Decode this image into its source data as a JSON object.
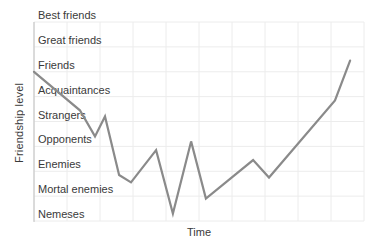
{
  "figure": {
    "y_axis_title": "Friendship level",
    "x_axis_title": "Time"
  },
  "chart_data": {
    "type": "line",
    "title": "",
    "xlabel": "Time",
    "ylabel": "Friendship level",
    "y_categories_bottom_up": [
      "Nemeses",
      "Mortal enemies",
      "Enemies",
      "Opponents",
      "Strangers",
      "Acquaintances",
      "Friends",
      "Great friends",
      "Best friends"
    ],
    "x_range": [
      0,
      100
    ],
    "y_range": [
      0,
      8
    ],
    "x_gridline_step": 10,
    "grid": true,
    "legend": false,
    "colors": {
      "line": "#8a8a8a",
      "gridline": "#ececec",
      "axis": "#c0c0c0",
      "text": "#3a3a3a"
    },
    "series": [
      {
        "name": "friendship-level",
        "points": [
          [
            0,
            6.0
          ],
          [
            13.9,
            4.45
          ],
          [
            18.5,
            3.4
          ],
          [
            21.5,
            4.2
          ],
          [
            25.8,
            1.85
          ],
          [
            29.4,
            1.55
          ],
          [
            37.0,
            2.85
          ],
          [
            42.1,
            0.3
          ],
          [
            47.6,
            3.2
          ],
          [
            52.1,
            0.9
          ],
          [
            66.4,
            2.45
          ],
          [
            71.2,
            1.75
          ],
          [
            91.2,
            4.85
          ],
          [
            95.8,
            6.45
          ]
        ]
      }
    ]
  }
}
